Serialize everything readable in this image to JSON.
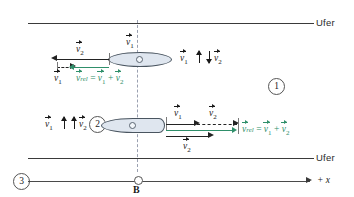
{
  "diagram": {
    "banks": {
      "top_label": "Ufer",
      "bottom_label": "Ufer"
    },
    "axis": {
      "label": "+ x"
    },
    "reference_point": {
      "label": "B"
    },
    "frames": [
      {
        "id": "1",
        "label": "1"
      },
      {
        "id": "2",
        "label": "2"
      },
      {
        "id": "3",
        "label": "3"
      }
    ],
    "upper_case": {
      "orientation_label": {
        "v1": "v",
        "v1_sub": "1",
        "v2": "v",
        "v2_sub": "2",
        "relation": "antiparallel"
      },
      "vectors": [
        {
          "name": "v2",
          "symbol": "v",
          "sub": "2",
          "direction": "left",
          "style": "solid-black"
        },
        {
          "name": "v1",
          "symbol": "v",
          "sub": "1",
          "direction": "left",
          "style": "dashed-black"
        },
        {
          "name": "v_rel",
          "symbol": "v",
          "sub": "rel",
          "direction": "left",
          "style": "solid-green"
        }
      ],
      "boat_label": {
        "symbol": "v",
        "sub": "1"
      },
      "result_equation": {
        "lhs_symbol": "v",
        "lhs_sub": "rel",
        "equals": "=",
        "term1_symbol": "v",
        "term1_sub": "1",
        "plus": "+",
        "term2_symbol": "v",
        "term2_sub": "2"
      }
    },
    "lower_case": {
      "orientation_label": {
        "v1": "v",
        "v1_sub": "1",
        "v2": "v",
        "v2_sub": "2",
        "relation": "parallel"
      },
      "vectors": [
        {
          "name": "v1",
          "symbol": "v",
          "sub": "1",
          "direction": "right",
          "style": "solid-black"
        },
        {
          "name": "v2_top",
          "symbol": "v",
          "sub": "2",
          "direction": "right",
          "style": "dashed-black"
        },
        {
          "name": "v2_bottom",
          "symbol": "v",
          "sub": "2",
          "direction": "right",
          "style": "solid-black"
        },
        {
          "name": "v_rel",
          "symbol": "v",
          "sub": "rel",
          "direction": "right",
          "style": "solid-green"
        }
      ],
      "result_equation": {
        "lhs_symbol": "v",
        "lhs_sub": "rel",
        "equals": "=",
        "term1_symbol": "v",
        "term1_sub": "1",
        "plus": "+",
        "term2_symbol": "v",
        "term2_sub": "2"
      }
    },
    "colors": {
      "resultant": "#2f8f6a",
      "vector": "#232323",
      "boat_fill": "#dfe6ef",
      "boat_stroke": "#4a5560",
      "bank": "#3a3a3a",
      "reference_line": "#9aa0b0"
    }
  }
}
